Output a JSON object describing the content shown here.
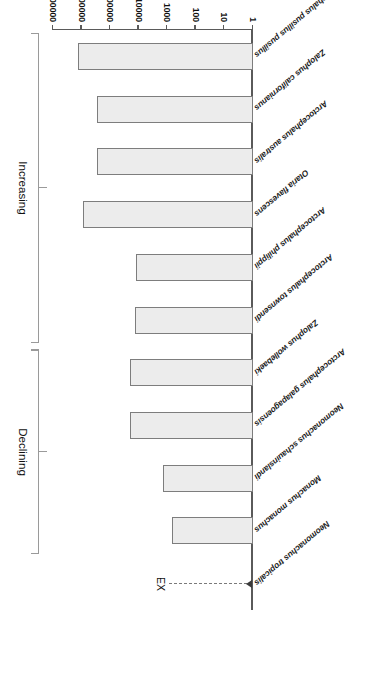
{
  "chart_data": {
    "type": "bar",
    "orientation": "horizontal",
    "title": "",
    "xlabel": "Total Population (Individuals)",
    "ylabel": "",
    "scale": "log",
    "xlim": [
      1,
      10000000
    ],
    "grid": false,
    "legend_position": "none",
    "tick_labels": [
      "1",
      "10",
      "100",
      "1000",
      "10000",
      "100000",
      "1000000",
      "10000000"
    ],
    "tick_values": [
      1,
      10,
      100,
      1000,
      10000,
      100000,
      1000000,
      10000000
    ],
    "categories": [
      "Neomonachus tropicalis",
      "Monachus monachus",
      "Neomonachus schauinslandi",
      "Arctocephalus galapagoensis",
      "Zalophus wollebaeki",
      "Arctocephalus townsendi",
      "Arctocephalus philippii",
      "Otaria flavescens",
      "Arctocephalus australis",
      "Zalophus californianus",
      "Arctocephalus pusillus pusillus"
    ],
    "values": [
      0,
      700,
      1400,
      20000,
      20000,
      13000,
      12000,
      900000,
      300000,
      300000,
      1300000
    ],
    "bar_fill": "#ececec",
    "bar_border": "#7d7d7d",
    "annotations": [
      {
        "name": "extinct-marker",
        "label": "EX",
        "category": "Neomonachus tropicalis",
        "style": "dashed-arrow-to-zero"
      }
    ],
    "groups": [
      {
        "label": "Declining",
        "members": [
          "Monachus monachus",
          "Neomonachus schauinslandi",
          "Arctocephalus galapagoensis",
          "Zalophus wollebaeki"
        ]
      },
      {
        "label": "Increasing",
        "members": [
          "Arctocephalus townsendi",
          "Arctocephalus philippii",
          "Otaria flavescens",
          "Arctocephalus australis",
          "Zalophus californianus",
          "Arctocephalus pusillus pusillus"
        ]
      }
    ]
  }
}
